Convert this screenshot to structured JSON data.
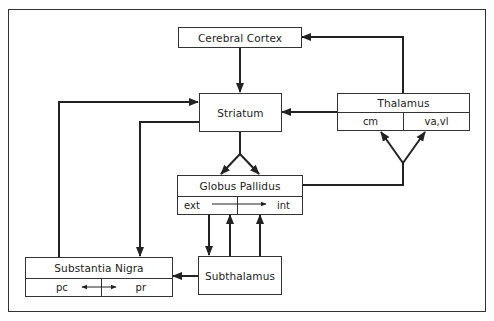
{
  "diagram": {
    "nodes": {
      "cortex": {
        "label": "Cerebral Cortex"
      },
      "striatum": {
        "label": "Striatum"
      },
      "thalamus": {
        "label": "Thalamus",
        "sub": [
          "cm",
          "va,vl"
        ]
      },
      "globus_pallidus": {
        "label": "Globus Pallidus",
        "sub": [
          "ext",
          "int"
        ]
      },
      "substantia_nigra": {
        "label": "Substantia Nigra",
        "sub": [
          "pc",
          "pr"
        ]
      },
      "subthalamus": {
        "label": "Subthalamus"
      }
    },
    "edges": [
      {
        "from": "Cerebral Cortex",
        "to": "Striatum"
      },
      {
        "from": "Thalamus",
        "to": "Cerebral Cortex"
      },
      {
        "from": "Thalamus",
        "to": "Striatum"
      },
      {
        "from": "Striatum",
        "to": "Globus Pallidus (ext)"
      },
      {
        "from": "Striatum",
        "to": "Globus Pallidus (int)"
      },
      {
        "from": "Globus Pallidus",
        "to": "Thalamus (cm)"
      },
      {
        "from": "Globus Pallidus",
        "to": "Thalamus (va,vl)"
      },
      {
        "from": "Globus Pallidus (ext)",
        "to": "Globus Pallidus (int)"
      },
      {
        "from": "Globus Pallidus (ext)",
        "to": "Subthalamus"
      },
      {
        "from": "Subthalamus",
        "to": "Globus Pallidus (ext)"
      },
      {
        "from": "Subthalamus",
        "to": "Globus Pallidus (int)"
      },
      {
        "from": "Subthalamus",
        "to": "Substantia Nigra"
      },
      {
        "from": "Substantia Nigra",
        "to": "Striatum"
      },
      {
        "from": "Striatum",
        "to": "Substantia Nigra"
      },
      {
        "from": "Substantia Nigra (pc)",
        "to": "Substantia Nigra (pr)",
        "bidirectional": true
      }
    ]
  }
}
